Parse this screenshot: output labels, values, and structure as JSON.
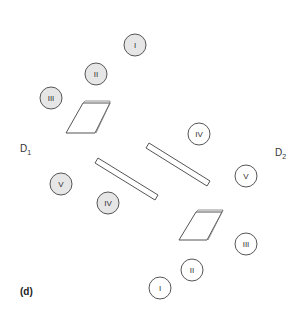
{
  "figure": {
    "panel_label": "(d)",
    "dimers": [
      {
        "label": "D",
        "subscript": "1",
        "x": 20,
        "y": 150
      },
      {
        "label": "D",
        "subscript": "2",
        "x": 275,
        "y": 155
      }
    ],
    "circles": [
      {
        "id": "I-top",
        "text": "I",
        "cx": 135,
        "cy": 45,
        "filled": true
      },
      {
        "id": "II-top",
        "text": "II",
        "cx": 96,
        "cy": 74,
        "filled": true
      },
      {
        "id": "III-top",
        "text": "III",
        "cx": 51,
        "cy": 98,
        "filled": true
      },
      {
        "id": "V-left",
        "text": "V",
        "cx": 61,
        "cy": 184,
        "filled": true
      },
      {
        "id": "IV-left",
        "text": "IV",
        "cx": 108,
        "cy": 203,
        "filled": true
      },
      {
        "id": "IV-right",
        "text": "IV",
        "cx": 199,
        "cy": 134,
        "filled": false
      },
      {
        "id": "V-right",
        "text": "V",
        "cx": 246,
        "cy": 176,
        "filled": false
      },
      {
        "id": "III-right",
        "text": "III",
        "cx": 246,
        "cy": 244,
        "filled": false
      },
      {
        "id": "II-bottom",
        "text": "II",
        "cx": 192,
        "cy": 270,
        "filled": false
      },
      {
        "id": "I-bottom",
        "text": "I",
        "cx": 160,
        "cy": 288,
        "filled": false
      }
    ],
    "colors": {
      "filled_circle": "#e6e6e6",
      "stroke": "#555555",
      "text": "#333333"
    }
  }
}
